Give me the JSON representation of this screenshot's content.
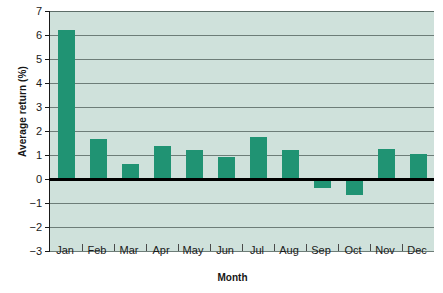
{
  "chart_data": {
    "type": "bar",
    "title": "",
    "xlabel": "Month",
    "ylabel": "Average return (%)",
    "categories": [
      "Jan",
      "Feb",
      "Mar",
      "Apr",
      "May",
      "Jun",
      "Jul",
      "Aug",
      "Sep",
      "Oct",
      "Nov",
      "Dec"
    ],
    "values": [
      6.2,
      1.65,
      0.62,
      1.37,
      1.2,
      0.9,
      1.75,
      1.2,
      -0.37,
      -0.65,
      1.25,
      1.05
    ],
    "ylim": [
      -3,
      7
    ],
    "yticks": [
      7,
      6,
      5,
      4,
      3,
      2,
      1,
      0,
      -1,
      -2,
      -3
    ],
    "ytick_labels": [
      "7",
      "6",
      "5",
      "4",
      "3",
      "2",
      "1",
      "0",
      "−1",
      "−2",
      "−3"
    ],
    "grid": true,
    "legend": false,
    "series_name": "Average return",
    "colors": {
      "bar": "#209373",
      "plot_background": "#cfe1db",
      "gridline": "#6d7d78",
      "zero_line": "#000000",
      "axis": "#1a1a1a",
      "page_background": "#ffffff"
    }
  }
}
